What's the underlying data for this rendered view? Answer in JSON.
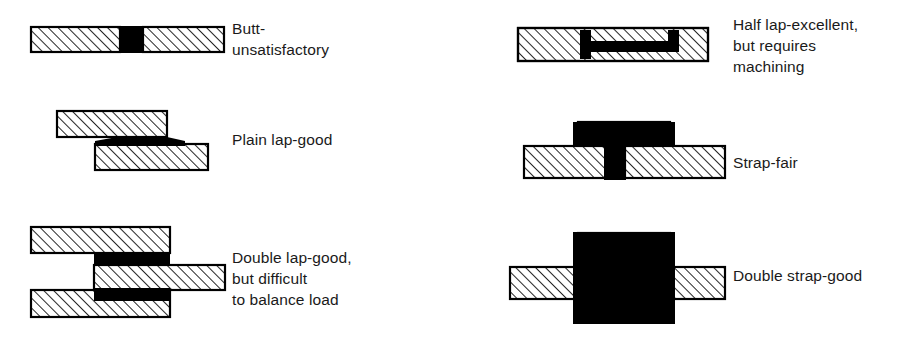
{
  "figure": {
    "background_color": "#ffffff",
    "ink_color": "#000000",
    "adhesive_color": "#000000",
    "metal_fill": "#ffffff"
  },
  "joints": [
    {
      "id": "butt",
      "name": "butt-joint",
      "label": "Butt-\nunsatisfactory",
      "rating": "unsatisfactory",
      "label_x": 232,
      "label_y": 18
    },
    {
      "id": "plain-lap",
      "name": "plain-lap-joint",
      "label": "Plain lap-good",
      "rating": "good",
      "label_x": 232,
      "label_y": 129
    },
    {
      "id": "double-lap",
      "name": "double-lap-joint",
      "label": "Double lap-good,\nbut difficult\nto balance load",
      "rating": "good",
      "label_x": 232,
      "label_y": 247
    },
    {
      "id": "half-lap",
      "name": "half-lap-joint",
      "label": "Half lap-excellent,\nbut requires\nmachining",
      "rating": "excellent",
      "label_x": 733,
      "label_y": 14
    },
    {
      "id": "strap",
      "name": "strap-joint",
      "label": "Strap-fair",
      "rating": "fair",
      "label_x": 733,
      "label_y": 152
    },
    {
      "id": "double-strap",
      "name": "double-strap-joint",
      "label": "Double strap-good",
      "rating": "good",
      "label_x": 733,
      "label_y": 265
    }
  ]
}
